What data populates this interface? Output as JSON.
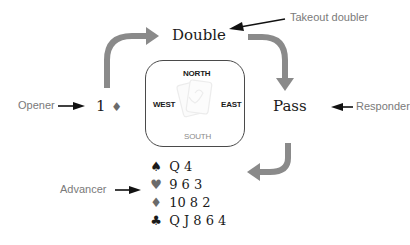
{
  "diagram": {
    "bids": {
      "opener": "1",
      "opener_suit": "♦",
      "takeout_doubler": "Double",
      "responder": "Pass"
    },
    "roles": {
      "opener": "Opener",
      "takeout_doubler": "Takeout doubler",
      "responder": "Responder",
      "advancer": "Advancer"
    },
    "table": {
      "north": "NORTH",
      "south": "SOUTH",
      "east": "EAST",
      "west": "WEST",
      "center_icon": "playing-cards-icon"
    },
    "advancer_hand": [
      {
        "suit": "♠",
        "suit_name": "spades",
        "cards": "Q 4"
      },
      {
        "suit": "♥",
        "suit_name": "hearts",
        "cards": "9 6 3"
      },
      {
        "suit": "♦",
        "suit_name": "diamonds",
        "cards": "10 8 2"
      },
      {
        "suit": "♣",
        "suit_name": "clubs",
        "cards": "Q J 8 6 4"
      }
    ],
    "colors": {
      "flow_arrow": "#8a8a8a",
      "pointer_arrow": "#111111",
      "role_text": "#7a7a7a",
      "bid_text": "#1a1a1a",
      "red_suit": "#6b6b6b"
    }
  }
}
